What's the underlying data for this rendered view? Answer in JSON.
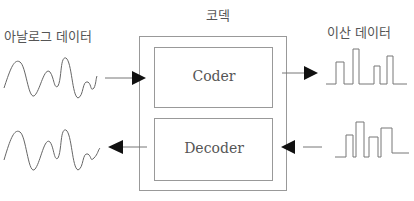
{
  "diagram": {
    "codec_label": "코덱",
    "analog_label": "아날로그 데이터",
    "digital_label": "이산 데이터",
    "coder_label": "Coder",
    "decoder_label": "Decoder"
  },
  "colors": {
    "line": "#888888",
    "arrow": "#111111",
    "text": "#555555"
  }
}
